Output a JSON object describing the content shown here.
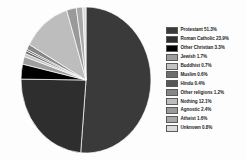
{
  "chart_data": {
    "type": "pie",
    "title": "",
    "legend_position": "right",
    "start_angle_deg": 0,
    "direction": "clockwise",
    "labels": [
      "Protestant",
      "Roman Catholic",
      "Other Christian",
      "Jewish",
      "Buddhist",
      "Muslim",
      "Hindu",
      "Other religions",
      "Nothing",
      "Agnostic",
      "Atheist",
      "Unknown"
    ],
    "values": [
      51.3,
      23.9,
      3.3,
      1.7,
      0.7,
      0.6,
      0.4,
      1.2,
      12.1,
      2.4,
      1.6,
      0.8
    ],
    "colors": [
      "#3a3a3a",
      "#2e2e2e",
      "#000000",
      "#9e9e9e",
      "#c3c3c3",
      "#6e6e6e",
      "#565656",
      "#868686",
      "#bdbdbd",
      "#9a9a9a",
      "#a8a8a8",
      "#dcdcdc"
    ],
    "legend_entries": [
      {
        "label": "Protestant 51.3%",
        "color": "#3a3a3a"
      },
      {
        "label": "Roman Catholic 23.9%",
        "color": "#2e2e2e"
      },
      {
        "label": "Other Christian 3.3%",
        "color": "#000000"
      },
      {
        "label": "Jewish 1.7%",
        "color": "#9e9e9e"
      },
      {
        "label": "Buddhist 0.7%",
        "color": "#c3c3c3"
      },
      {
        "label": "Muslim 0.6%",
        "color": "#6e6e6e"
      },
      {
        "label": "Hindu 0.4%",
        "color": "#565656"
      },
      {
        "label": "Other religions 1.2%",
        "color": "#868686"
      },
      {
        "label": "Nothing 12.1%",
        "color": "#bdbdbd"
      },
      {
        "label": "Agnostic 2.4%",
        "color": "#9a9a9a"
      },
      {
        "label": "Atheist 1.6%",
        "color": "#a8a8a8"
      },
      {
        "label": "Unknown 0.8%",
        "color": "#dcdcdc"
      }
    ]
  }
}
